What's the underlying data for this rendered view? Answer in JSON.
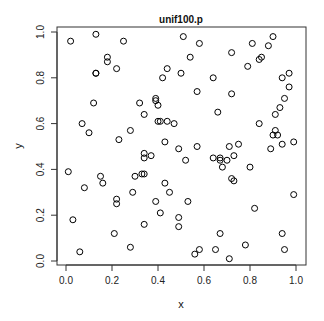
{
  "chart_data": {
    "type": "scatter",
    "title": "unif100.p",
    "xlabel": "x",
    "ylabel": "y",
    "xlim": [
      -0.04,
      1.04
    ],
    "ylim": [
      -0.02,
      1.04
    ],
    "xticks": [
      0.0,
      0.2,
      0.4,
      0.6,
      0.8,
      1.0
    ],
    "xtick_labels": [
      "0.0",
      "0.2",
      "0.4",
      "0.6",
      "0.8",
      "1.0"
    ],
    "yticks": [
      0.0,
      0.2,
      0.4,
      0.6,
      0.8,
      1.0
    ],
    "ytick_labels": [
      "0.0",
      "0.2",
      "0.4",
      "0.6",
      "0.8",
      "1.0"
    ],
    "grid": false,
    "marker": "open-circle",
    "marker_color": "#000000",
    "points": [
      [
        0.02,
        0.96
      ],
      [
        0.13,
        0.99
      ],
      [
        0.25,
        0.96
      ],
      [
        0.18,
        0.89
      ],
      [
        0.18,
        0.87
      ],
      [
        0.22,
        0.84
      ],
      [
        0.13,
        0.82
      ],
      [
        0.13,
        0.82
      ],
      [
        0.12,
        0.69
      ],
      [
        0.32,
        0.69
      ],
      [
        0.51,
        0.98
      ],
      [
        0.58,
        0.95
      ],
      [
        0.54,
        0.89
      ],
      [
        0.44,
        0.84
      ],
      [
        0.5,
        0.82
      ],
      [
        0.42,
        0.8
      ],
      [
        0.64,
        0.8
      ],
      [
        0.57,
        0.74
      ],
      [
        0.39,
        0.71
      ],
      [
        0.39,
        0.7
      ],
      [
        0.4,
        0.68
      ],
      [
        0.9,
        0.98
      ],
      [
        0.81,
        0.95
      ],
      [
        0.88,
        0.94
      ],
      [
        0.72,
        0.91
      ],
      [
        0.85,
        0.89
      ],
      [
        0.84,
        0.88
      ],
      [
        0.79,
        0.85
      ],
      [
        0.97,
        0.82
      ],
      [
        0.94,
        0.8
      ],
      [
        0.97,
        0.76
      ],
      [
        0.72,
        0.73
      ],
      [
        0.95,
        0.71
      ],
      [
        0.93,
        0.67
      ],
      [
        0.91,
        0.64
      ],
      [
        0.34,
        0.64
      ],
      [
        0.44,
        0.61
      ],
      [
        0.66,
        0.65
      ],
      [
        0.4,
        0.61
      ],
      [
        0.41,
        0.61
      ],
      [
        0.47,
        0.6
      ],
      [
        0.07,
        0.6
      ],
      [
        0.1,
        0.56
      ],
      [
        0.28,
        0.57
      ],
      [
        0.23,
        0.53
      ],
      [
        0.34,
        0.47
      ],
      [
        0.43,
        0.52
      ],
      [
        0.57,
        0.5
      ],
      [
        0.49,
        0.49
      ],
      [
        0.71,
        0.5
      ],
      [
        0.75,
        0.51
      ],
      [
        0.94,
        0.51
      ],
      [
        0.84,
        0.6
      ],
      [
        0.9,
        0.55
      ],
      [
        0.91,
        0.57
      ],
      [
        0.92,
        0.55
      ],
      [
        0.89,
        0.49
      ],
      [
        0.99,
        0.52
      ],
      [
        0.34,
        0.45
      ],
      [
        0.37,
        0.46
      ],
      [
        0.64,
        0.45
      ],
      [
        0.67,
        0.45
      ],
      [
        0.52,
        0.44
      ],
      [
        0.67,
        0.44
      ],
      [
        0.7,
        0.44
      ],
      [
        0.68,
        0.41
      ],
      [
        0.73,
        0.46
      ],
      [
        0.8,
        0.41
      ],
      [
        0.01,
        0.39
      ],
      [
        0.15,
        0.37
      ],
      [
        0.3,
        0.37
      ],
      [
        0.33,
        0.38
      ],
      [
        0.34,
        0.38
      ],
      [
        0.16,
        0.34
      ],
      [
        0.72,
        0.36
      ],
      [
        0.73,
        0.35
      ],
      [
        0.08,
        0.32
      ],
      [
        0.29,
        0.3
      ],
      [
        0.43,
        0.34
      ],
      [
        0.22,
        0.27
      ],
      [
        0.22,
        0.25
      ],
      [
        0.45,
        0.3
      ],
      [
        0.39,
        0.26
      ],
      [
        0.53,
        0.26
      ],
      [
        0.99,
        0.29
      ],
      [
        0.41,
        0.21
      ],
      [
        0.03,
        0.18
      ],
      [
        0.34,
        0.16
      ],
      [
        0.49,
        0.19
      ],
      [
        0.49,
        0.15
      ],
      [
        0.67,
        0.12
      ],
      [
        0.82,
        0.23
      ],
      [
        0.21,
        0.12
      ],
      [
        0.94,
        0.12
      ],
      [
        0.28,
        0.06
      ],
      [
        0.06,
        0.04
      ],
      [
        0.58,
        0.05
      ],
      [
        0.56,
        0.03
      ],
      [
        0.65,
        0.05
      ],
      [
        0.71,
        0.01
      ],
      [
        0.78,
        0.07
      ],
      [
        0.95,
        0.05
      ]
    ]
  }
}
